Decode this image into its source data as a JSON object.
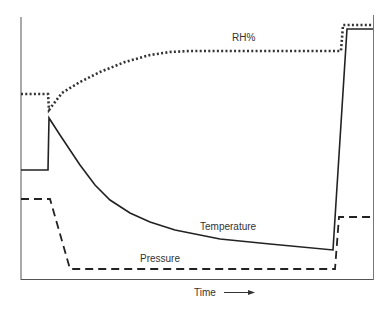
{
  "chart_data": {
    "type": "line",
    "title": "",
    "xlabel": "Time",
    "ylabel": "",
    "grid": false,
    "legend": "inline labels",
    "x_arrow": true,
    "series": [
      {
        "name": "RH%",
        "style": "dotted",
        "color": "#333333",
        "points": [
          [
            21,
            94
          ],
          [
            48,
            94
          ],
          [
            49,
            110
          ],
          [
            55,
            102
          ],
          [
            62,
            93
          ],
          [
            80,
            82
          ],
          [
            100,
            72
          ],
          [
            125,
            62
          ],
          [
            150,
            55
          ],
          [
            170,
            52
          ],
          [
            190,
            51
          ],
          [
            341,
            51
          ],
          [
            343,
            25
          ],
          [
            373,
            25
          ]
        ]
      },
      {
        "name": "Temperature",
        "style": "solid",
        "color": "#222222",
        "points": [
          [
            21,
            170
          ],
          [
            48,
            170
          ],
          [
            49,
            118
          ],
          [
            60,
            135
          ],
          [
            70,
            150
          ],
          [
            80,
            165
          ],
          [
            95,
            185
          ],
          [
            110,
            200
          ],
          [
            130,
            213
          ],
          [
            150,
            222
          ],
          [
            175,
            230
          ],
          [
            200,
            235
          ],
          [
            220,
            239
          ],
          [
            270,
            244
          ],
          [
            333,
            250
          ],
          [
            347,
            29
          ],
          [
            373,
            29
          ]
        ]
      },
      {
        "name": "Pressure",
        "style": "dashed",
        "color": "#222222",
        "points": [
          [
            21,
            199
          ],
          [
            50,
            199
          ],
          [
            70,
            269
          ],
          [
            335,
            269
          ],
          [
            339,
            217
          ],
          [
            373,
            217
          ]
        ]
      }
    ],
    "annotations": [
      {
        "text": "RH%",
        "x": 232,
        "y": 41
      },
      {
        "text": "Temperature",
        "x": 200,
        "y": 230
      },
      {
        "text": "Pressure",
        "x": 140,
        "y": 262
      },
      {
        "text": "Time",
        "x": 194,
        "y": 296
      }
    ]
  },
  "labels": {
    "rh": "RH%",
    "temperature": "Temperature",
    "pressure": "Pressure",
    "time": "Time"
  }
}
